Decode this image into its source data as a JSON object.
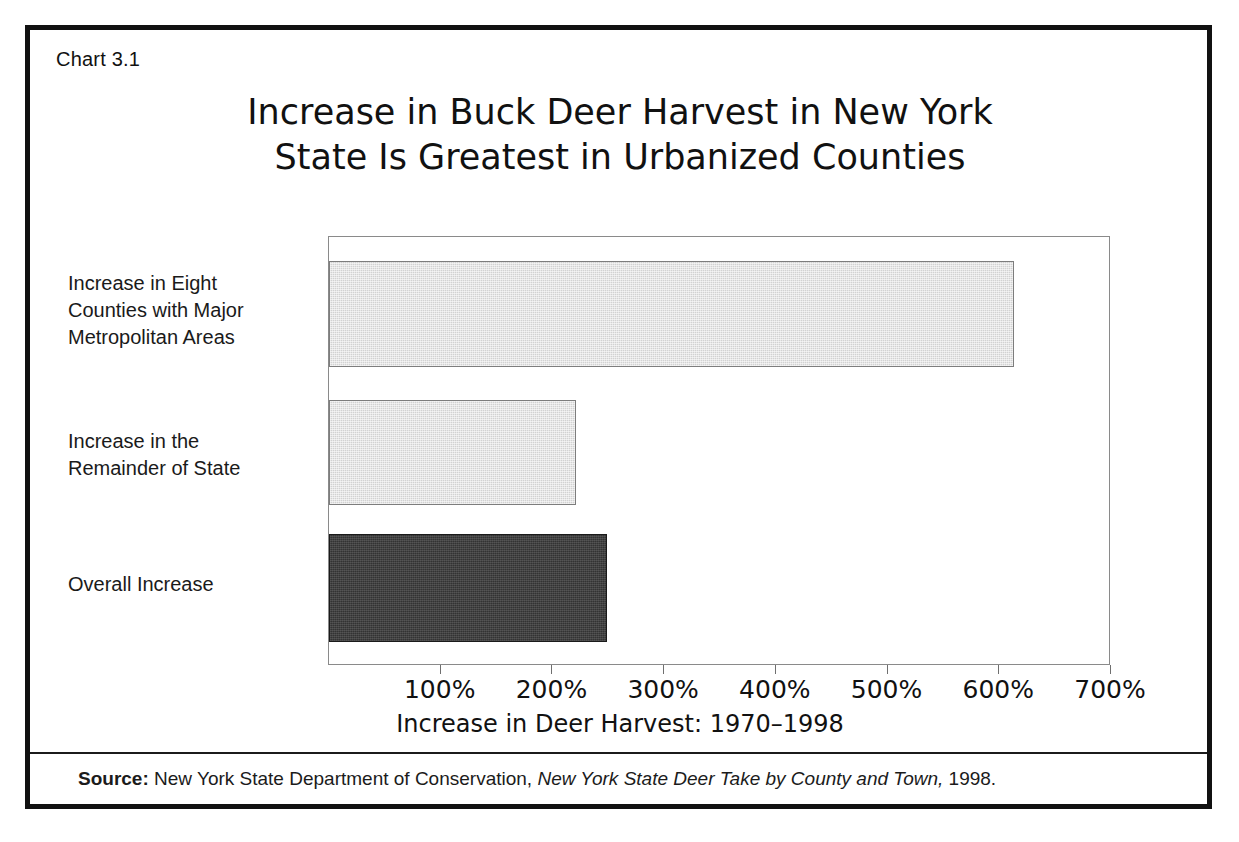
{
  "figure": {
    "number_label": "Chart 3.1",
    "title_line1": "Increase in Buck Deer Harvest in New York",
    "title_line2": "State Is Greatest in Urbanized Counties"
  },
  "source": {
    "prefix": "Source:",
    "agency": " New York State Department of Conservation, ",
    "publication": "New York State Deer Take by County and Town,",
    "year": " 1998."
  },
  "categories": {
    "cat0_line1": "Increase in Eight",
    "cat0_line2": "Counties with Major",
    "cat0_line3": "Metropolitan Areas",
    "cat1_line1": "Increase in the",
    "cat1_line2": "Remainder of State",
    "cat2_line1": "Overall Increase"
  },
  "axis": {
    "ticks": [
      "100%",
      "200%",
      "300%",
      "400%",
      "500%",
      "600%",
      "700%"
    ],
    "title": "Increase in Deer Harvest: 1970–1998"
  },
  "chart_data": {
    "type": "bar",
    "orientation": "horizontal",
    "title": "Increase in Buck Deer Harvest in New York State Is Greatest in Urbanized Counties",
    "subtitle": "",
    "xlabel": "Increase in Deer Harvest: 1970–1998",
    "ylabel": "",
    "categories": [
      "Increase in Eight Counties with Major Metropolitan Areas",
      "Increase in the Remainder of State",
      "Overall Increase"
    ],
    "values": [
      613,
      221,
      249
    ],
    "value_unit": "percent",
    "xlim": [
      0,
      700
    ],
    "xticks": [
      100,
      200,
      300,
      400,
      500,
      600,
      700
    ],
    "xtick_labels": [
      "100%",
      "200%",
      "300%",
      "400%",
      "500%",
      "600%",
      "700%"
    ],
    "grid": false,
    "legend": false,
    "bar_colors": [
      "#d2d2d2",
      "#d2d2d2",
      "#333333"
    ],
    "bar_edge_color": "#7d7d7d",
    "source": "New York State Department of Conservation, New York State Deer Take by County and Town, 1998."
  }
}
